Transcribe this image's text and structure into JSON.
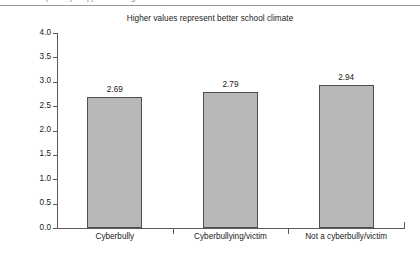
{
  "top_strip": {
    "clipped_text": "partially cropped heading text"
  },
  "chart_data": {
    "type": "bar",
    "title": "Higher values represent better school climate",
    "xlabel": "",
    "ylabel": "",
    "categories": [
      "Cyberbully",
      "Cyberbullying/victim",
      "Not a cyberbully/victim"
    ],
    "values": [
      2.69,
      2.79,
      2.94
    ],
    "value_labels": [
      "2.69",
      "2.79",
      "2.94"
    ],
    "ylim": [
      0.0,
      4.0
    ],
    "ytick_labels": [
      "0.0",
      "0.5",
      "1.0",
      "1.5",
      "2.0",
      "2.5",
      "3.0",
      "3.5",
      "4.0"
    ],
    "ytick_values": [
      0.0,
      0.5,
      1.0,
      1.5,
      2.0,
      2.5,
      3.0,
      3.5,
      4.0
    ],
    "grid": false,
    "legend": false,
    "bar_color": "#b8b8b8",
    "bar_border_color": "#4f4f4f",
    "axis_color": "#5a5a5a",
    "background_color": "#ffffff"
  }
}
